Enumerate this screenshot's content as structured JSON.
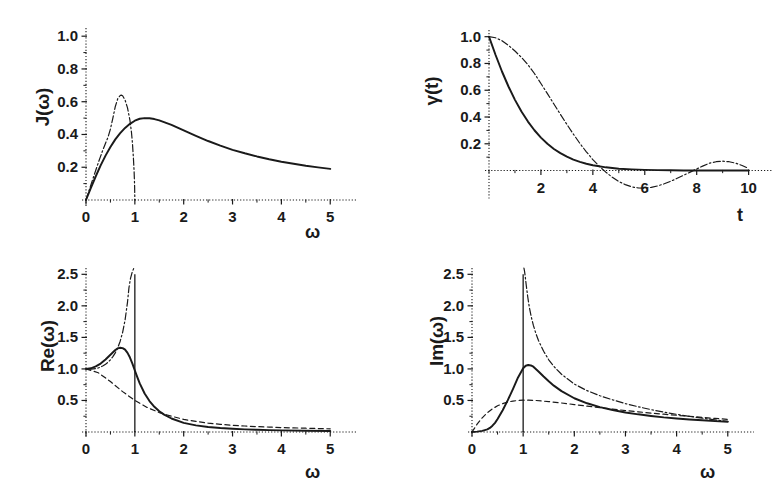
{
  "figure": {
    "width": 772,
    "height": 482,
    "background": "#ffffff",
    "ink_color": "#1a1a1a",
    "panel_count": 4
  },
  "chart_data": [
    {
      "id": "panel-J-omega",
      "type": "line",
      "title": "",
      "xlabel": "ω",
      "ylabel": "J(ω)",
      "xlim": [
        0,
        5.2
      ],
      "ylim": [
        0,
        1.05
      ],
      "xticks": [
        0,
        1,
        2,
        3,
        4,
        5
      ],
      "xticklabels": [
        "0",
        "1",
        "2",
        "3",
        "4",
        "5"
      ],
      "yticks": [
        0.2,
        0.4,
        0.6,
        0.8,
        1.0
      ],
      "yticklabels": [
        "0.2",
        "0.4",
        "0.6",
        "0.8",
        "1.0"
      ],
      "minor_ticks": true,
      "grid": false,
      "legend": "none",
      "series": [
        {
          "name": "ohmic-lorentzian-cutoff",
          "style": "solid",
          "x": [
            0.0,
            0.1,
            0.2,
            0.3,
            0.4,
            0.5,
            0.6,
            0.7,
            0.8,
            0.9,
            1.0,
            1.1,
            1.2,
            1.3,
            1.4,
            1.5,
            1.75,
            2.0,
            2.25,
            2.5,
            2.75,
            3.0,
            3.25,
            3.5,
            3.75,
            4.0,
            4.25,
            4.5,
            4.75,
            5.0
          ],
          "y": [
            0.0,
            0.074,
            0.145,
            0.211,
            0.271,
            0.324,
            0.37,
            0.408,
            0.44,
            0.465,
            0.484,
            0.496,
            0.5,
            0.499,
            0.494,
            0.486,
            0.459,
            0.425,
            0.392,
            0.36,
            0.332,
            0.306,
            0.285,
            0.266,
            0.249,
            0.234,
            0.221,
            0.209,
            0.199,
            0.19
          ]
        },
        {
          "name": "debye-semicircular-cutoff",
          "style": "dashdot",
          "x": [
            0.0,
            0.05,
            0.1,
            0.15,
            0.2,
            0.25,
            0.3,
            0.35,
            0.4,
            0.45,
            0.5,
            0.55,
            0.6,
            0.65,
            0.7,
            0.72,
            0.75,
            0.8,
            0.85,
            0.9,
            0.93,
            0.95,
            0.97,
            0.985,
            0.995,
            1.0
          ],
          "y": [
            0.0,
            0.046,
            0.092,
            0.137,
            0.182,
            0.226,
            0.268,
            0.309,
            0.347,
            0.383,
            0.433,
            0.5,
            0.571,
            0.618,
            0.638,
            0.64,
            0.636,
            0.61,
            0.562,
            0.486,
            0.415,
            0.35,
            0.26,
            0.175,
            0.09,
            0.0
          ]
        }
      ]
    },
    {
      "id": "panel-gamma-t",
      "type": "line",
      "title": "",
      "xlabel": "t",
      "ylabel": "γ(t)",
      "xlim": [
        0,
        10.4
      ],
      "ylim": [
        -0.22,
        1.05
      ],
      "xticks": [
        2,
        4,
        6,
        8,
        10
      ],
      "xticklabels": [
        "2",
        "4",
        "6",
        "8",
        "10"
      ],
      "yticks": [
        0.2,
        0.4,
        0.6,
        0.8,
        1.0
      ],
      "yticklabels": [
        "0.2",
        "0.4",
        "0.6",
        "0.8",
        "1.0"
      ],
      "minor_ticks": true,
      "grid": false,
      "legend": "none",
      "series": [
        {
          "name": "exponential-decay",
          "style": "solid",
          "x": [
            0.0,
            0.25,
            0.5,
            0.75,
            1.0,
            1.25,
            1.5,
            1.75,
            2.0,
            2.25,
            2.5,
            2.75,
            3.0,
            3.25,
            3.5,
            3.75,
            4.0,
            4.5,
            5.0,
            5.5,
            6.0,
            6.5,
            7.0,
            7.5,
            8.0,
            8.5,
            9.0,
            9.5,
            10.0
          ],
          "y": [
            1.0,
            0.865,
            0.74,
            0.628,
            0.528,
            0.441,
            0.366,
            0.301,
            0.246,
            0.2,
            0.161,
            0.13,
            0.104,
            0.082,
            0.065,
            0.051,
            0.04,
            0.024,
            0.014,
            0.009,
            0.005,
            0.003,
            0.002,
            0.001,
            0.001,
            0.0,
            0.0,
            0.0,
            0.0
          ]
        },
        {
          "name": "bessel-oscillatory",
          "style": "dashdot",
          "x": [
            0.0,
            0.25,
            0.5,
            0.75,
            1.0,
            1.25,
            1.5,
            1.75,
            2.0,
            2.25,
            2.5,
            2.75,
            3.0,
            3.25,
            3.5,
            3.75,
            4.0,
            4.25,
            4.5,
            4.75,
            5.0,
            5.25,
            5.5,
            5.75,
            6.0,
            6.25,
            6.5,
            6.75,
            7.0,
            7.25,
            7.5,
            7.75,
            8.0,
            8.25,
            8.5,
            8.75,
            9.0,
            9.25,
            9.5,
            9.75,
            10.0
          ],
          "y": [
            1.0,
            0.992,
            0.97,
            0.935,
            0.893,
            0.845,
            0.79,
            0.725,
            0.65,
            0.575,
            0.497,
            0.42,
            0.345,
            0.272,
            0.203,
            0.14,
            0.082,
            0.032,
            -0.012,
            -0.05,
            -0.082,
            -0.105,
            -0.122,
            -0.13,
            -0.131,
            -0.126,
            -0.115,
            -0.099,
            -0.08,
            -0.058,
            -0.035,
            -0.012,
            0.012,
            0.035,
            0.056,
            0.066,
            0.07,
            0.066,
            0.055,
            0.038,
            0.016
          ]
        }
      ]
    },
    {
      "id": "panel-Re-omega",
      "type": "line",
      "title": "",
      "xlabel": "ω",
      "ylabel": "Re(ω)",
      "xlim": [
        0,
        5.2
      ],
      "ylim": [
        0,
        2.6
      ],
      "xticks": [
        0,
        1,
        2,
        3,
        4,
        5
      ],
      "xticklabels": [
        "0",
        "1",
        "2",
        "3",
        "4",
        "5"
      ],
      "yticks": [
        0.5,
        1.0,
        1.5,
        2.0,
        2.5
      ],
      "yticklabels": [
        "0.5",
        "1.0",
        "1.5",
        "2.0",
        "2.5"
      ],
      "minor_ticks": true,
      "grid": false,
      "legend": "none",
      "vertical_marker": {
        "x": 1.0,
        "style": "solid",
        "y_from": 0.0,
        "y_to": 2.5
      },
      "series": [
        {
          "name": "full-response-solid",
          "style": "solid",
          "x": [
            0.0,
            0.1,
            0.2,
            0.3,
            0.4,
            0.5,
            0.6,
            0.65,
            0.7,
            0.75,
            0.8,
            0.85,
            0.9,
            0.95,
            1.0,
            1.05,
            1.1,
            1.2,
            1.3,
            1.4,
            1.5,
            1.6,
            1.75,
            2.0,
            2.25,
            2.5,
            2.75,
            3.0,
            3.25,
            3.5,
            3.75,
            4.0,
            4.5,
            5.0
          ],
          "y": [
            1.0,
            1.01,
            1.04,
            1.085,
            1.15,
            1.225,
            1.3,
            1.325,
            1.335,
            1.33,
            1.305,
            1.255,
            1.18,
            1.085,
            0.975,
            0.87,
            0.77,
            0.61,
            0.49,
            0.4,
            0.33,
            0.275,
            0.214,
            0.145,
            0.105,
            0.08,
            0.063,
            0.051,
            0.042,
            0.035,
            0.03,
            0.026,
            0.019,
            0.015
          ]
        },
        {
          "name": "divergent-dashdot",
          "style": "dashdot",
          "x": [
            0.05,
            0.1,
            0.15,
            0.2,
            0.25,
            0.3,
            0.35,
            0.4,
            0.45,
            0.5,
            0.55,
            0.6,
            0.65,
            0.7,
            0.75,
            0.8,
            0.85,
            0.88,
            0.91,
            0.94,
            0.96,
            0.975,
            0.985
          ],
          "y": [
            0.995,
            0.995,
            1.0,
            1.005,
            1.015,
            1.03,
            1.05,
            1.075,
            1.105,
            1.145,
            1.195,
            1.255,
            1.335,
            1.44,
            1.58,
            1.775,
            2.06,
            2.29,
            2.43,
            2.52,
            2.56,
            2.59,
            2.6
          ]
        },
        {
          "name": "baseline-dashed",
          "style": "dashed",
          "x": [
            0.0,
            0.25,
            0.5,
            0.75,
            1.0,
            1.25,
            1.5,
            1.75,
            2.0,
            2.25,
            2.5,
            2.75,
            3.0,
            3.25,
            3.5,
            3.75,
            4.0,
            4.25,
            4.5,
            4.75,
            5.0
          ],
          "y": [
            1.0,
            0.94,
            0.8,
            0.64,
            0.5,
            0.39,
            0.308,
            0.25,
            0.2,
            0.168,
            0.14,
            0.122,
            0.105,
            0.095,
            0.085,
            0.078,
            0.07,
            0.065,
            0.06,
            0.055,
            0.05
          ]
        }
      ]
    },
    {
      "id": "panel-Im-omega",
      "type": "line",
      "title": "",
      "xlabel": "ω",
      "ylabel": "Im(ω)",
      "xlim": [
        0,
        5.2
      ],
      "ylim": [
        0,
        2.6
      ],
      "xticks": [
        0,
        1,
        2,
        3,
        4,
        5
      ],
      "xticklabels": [
        "0",
        "1",
        "2",
        "3",
        "4",
        "5"
      ],
      "yticks": [
        0.5,
        1.0,
        1.5,
        2.0,
        2.5
      ],
      "yticklabels": [
        "0.5",
        "1.0",
        "1.5",
        "2.0",
        "2.5"
      ],
      "minor_ticks": true,
      "grid": false,
      "legend": "none",
      "vertical_marker": {
        "x": 1.0,
        "style": "solid",
        "y_from": 0.0,
        "y_to": 2.5
      },
      "series": [
        {
          "name": "full-response-solid",
          "style": "solid",
          "x": [
            0.0,
            0.1,
            0.2,
            0.3,
            0.35,
            0.4,
            0.45,
            0.5,
            0.6,
            0.7,
            0.8,
            0.9,
            1.0,
            1.05,
            1.1,
            1.15,
            1.2,
            1.3,
            1.4,
            1.5,
            1.6,
            1.75,
            2.0,
            2.25,
            2.5,
            2.75,
            3.0,
            3.25,
            3.5,
            3.75,
            4.0,
            4.25,
            4.5,
            4.75,
            5.0
          ],
          "y": [
            0.0,
            0.006,
            0.018,
            0.042,
            0.065,
            0.1,
            0.145,
            0.205,
            0.345,
            0.505,
            0.68,
            0.865,
            1.01,
            1.05,
            1.062,
            1.055,
            1.035,
            0.96,
            0.88,
            0.805,
            0.735,
            0.648,
            0.535,
            0.455,
            0.395,
            0.348,
            0.31,
            0.28,
            0.255,
            0.232,
            0.214,
            0.198,
            0.185,
            0.172,
            0.162
          ]
        },
        {
          "name": "divergent-dashdot",
          "style": "dashdot",
          "x": [
            1.015,
            1.025,
            1.04,
            1.06,
            1.09,
            1.12,
            1.16,
            1.2,
            1.25,
            1.3,
            1.4,
            1.5,
            1.6,
            1.75,
            2.0,
            2.25,
            2.5,
            2.75,
            3.0,
            3.25,
            3.5,
            3.75,
            4.0,
            4.25,
            4.5,
            4.75,
            5.0
          ],
          "y": [
            2.6,
            2.56,
            2.47,
            2.33,
            2.14,
            1.98,
            1.82,
            1.69,
            1.56,
            1.45,
            1.28,
            1.145,
            1.04,
            0.915,
            0.76,
            0.655,
            0.575,
            0.51,
            0.45,
            0.4,
            0.355,
            0.315,
            0.28,
            0.248,
            0.22,
            0.192,
            0.168
          ]
        },
        {
          "name": "baseline-dashed",
          "style": "dashed",
          "x": [
            0.0,
            0.1,
            0.2,
            0.3,
            0.4,
            0.5,
            0.6,
            0.7,
            0.8,
            0.9,
            1.0,
            1.1,
            1.25,
            1.5,
            1.75,
            2.0,
            2.25,
            2.5,
            2.75,
            3.0,
            3.25,
            3.5,
            3.75,
            4.0,
            4.25,
            4.5,
            4.75,
            5.0
          ],
          "y": [
            0.0,
            0.125,
            0.225,
            0.305,
            0.368,
            0.415,
            0.45,
            0.475,
            0.49,
            0.5,
            0.505,
            0.505,
            0.5,
            0.482,
            0.46,
            0.435,
            0.41,
            0.385,
            0.362,
            0.34,
            0.32,
            0.3,
            0.282,
            0.265,
            0.248,
            0.232,
            0.215,
            0.2
          ]
        }
      ]
    }
  ]
}
